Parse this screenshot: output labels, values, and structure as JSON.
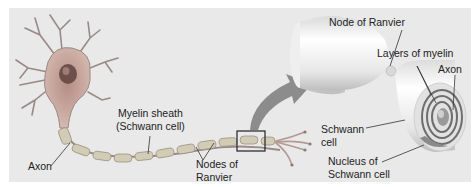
{
  "diagram": {
    "colors": {
      "background": "#e9e9e9",
      "neuron": "#c7a79d",
      "nucleus": "#7a5a55",
      "myelin_segment": "#d2ccb6",
      "arrow": "#8c8c8c",
      "cylinder": "#f4f4f4",
      "line": "#333333"
    },
    "labels": {
      "myelin_sheath": "Myelin sheath",
      "schwann_cell_paren": "(Schwann cell)",
      "axon_left": "Axon",
      "nodes_of": "Nodes of",
      "ranvier": "Ranvier",
      "node_of_ranvier": "Node of Ranvier",
      "layers_of_myelin": "Layers of myelin",
      "axon_right": "Axon",
      "schwann": "Schwann",
      "cell": "cell",
      "nucleus_of": "Nucleus of",
      "schwann_cell": "Schwann cell"
    }
  }
}
